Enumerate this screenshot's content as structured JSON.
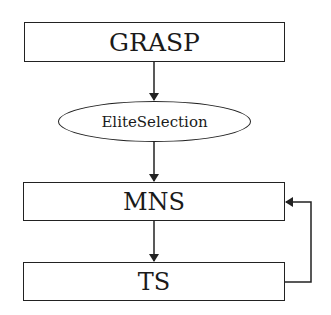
{
  "diagram": {
    "type": "flowchart",
    "nodes": [
      {
        "id": "grasp",
        "label": "GRASP",
        "shape": "rectangle"
      },
      {
        "id": "elite",
        "label": "EliteSelection",
        "shape": "ellipse"
      },
      {
        "id": "mns",
        "label": "MNS",
        "shape": "rectangle"
      },
      {
        "id": "ts",
        "label": "TS",
        "shape": "rectangle"
      }
    ],
    "edges": [
      {
        "from": "GRASP",
        "to": "EliteSelection"
      },
      {
        "from": "EliteSelection",
        "to": "MNS"
      },
      {
        "from": "MNS",
        "to": "TS"
      },
      {
        "from": "TS",
        "to": "MNS",
        "note": "feedback loop on right side"
      }
    ]
  },
  "colors": {
    "stroke": "#222222",
    "background": "#ffffff"
  }
}
